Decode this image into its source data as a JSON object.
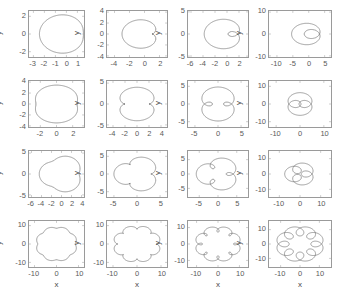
{
  "figure": {
    "title": "",
    "rows": 4,
    "cols": 4,
    "axis_color": "#9a9a9a",
    "curve_color": "#555555",
    "tick_color": "#5a5a5a",
    "background": "#ffffff"
  },
  "chart_data": {
    "type": "line",
    "title": "",
    "xlabel": "x",
    "ylabel": "y",
    "grid": false,
    "legend": "none",
    "panels": [
      {
        "row": 1,
        "col": 1,
        "k": 1,
        "d": 0.45,
        "xlabel": "",
        "ylabel": "y",
        "xlim": [
          -3.4,
          1.6
        ],
        "ylim": [
          -2.6,
          2.6
        ],
        "xticks": [
          -3,
          -2,
          -1,
          0,
          1
        ],
        "xticklabels": [
          "-3",
          "-2",
          "-1",
          "0",
          "1"
        ],
        "yticks": [
          -2,
          0,
          2
        ],
        "yticklabels": [
          "-2",
          "0",
          "2"
        ]
      },
      {
        "row": 1,
        "col": 2,
        "k": 1,
        "d": 1.0,
        "xlabel": "",
        "ylabel": "y",
        "xlim": [
          -5.0,
          3.0
        ],
        "ylim": [
          -4.2,
          4.2
        ],
        "xticks": [
          -4,
          -2,
          0,
          2
        ],
        "xticklabels": [
          "-4",
          "-2",
          "0",
          "2"
        ],
        "yticks": [
          -4,
          -2,
          0,
          2,
          4
        ],
        "yticklabels": [
          "-4",
          "-2",
          "0",
          "2",
          "4"
        ]
      },
      {
        "row": 1,
        "col": 3,
        "k": 1,
        "d": 1.8,
        "xlabel": "",
        "ylabel": "y",
        "xlim": [
          -6.5,
          3.5
        ],
        "ylim": [
          -5.2,
          5.2
        ],
        "xticks": [
          -6,
          -4,
          -2,
          0,
          2
        ],
        "xticklabels": [
          "-6",
          "-4",
          "-2",
          "0",
          "2"
        ],
        "yticks": [
          -5,
          0,
          5
        ],
        "yticklabels": [
          "-5",
          "0",
          "5"
        ]
      },
      {
        "row": 1,
        "col": 4,
        "k": 1,
        "d": 3.4,
        "xlabel": "",
        "ylabel": "y",
        "xlim": [
          -12.5,
          7.0
        ],
        "ylim": [
          -10.5,
          10.5
        ],
        "xticks": [
          -10,
          -5,
          0,
          5
        ],
        "xticklabels": [
          "-10",
          "-5",
          "0",
          "5"
        ],
        "yticks": [
          -10,
          0,
          10
        ],
        "yticklabels": [
          "-10",
          "0",
          "10"
        ]
      },
      {
        "row": 2,
        "col": 1,
        "k": 2,
        "d": 0.45,
        "xlabel": "",
        "ylabel": "y",
        "xlim": [
          -3.4,
          3.4
        ],
        "ylim": [
          -4.2,
          4.2
        ],
        "xticks": [
          -2,
          0,
          2
        ],
        "xticklabels": [
          "-2",
          "0",
          "2"
        ],
        "yticks": [
          -4,
          -2,
          0,
          2,
          4
        ],
        "yticklabels": [
          "-4",
          "-2",
          "0",
          "2",
          "4"
        ]
      },
      {
        "row": 2,
        "col": 2,
        "k": 2,
        "d": 1.0,
        "xlabel": "",
        "ylabel": "y",
        "xlim": [
          -5.0,
          5.0
        ],
        "ylim": [
          -5.5,
          5.5
        ],
        "xticks": [
          -4,
          -2,
          0,
          2,
          4
        ],
        "xticklabels": [
          "-4",
          "-2",
          "0",
          "2",
          "4"
        ],
        "yticks": [
          -5,
          0,
          5
        ],
        "yticklabels": [
          "-5",
          "0",
          "5"
        ]
      },
      {
        "row": 2,
        "col": 3,
        "k": 2,
        "d": 1.8,
        "xlabel": "",
        "ylabel": "y",
        "xlim": [
          -6.5,
          6.5
        ],
        "ylim": [
          -6.5,
          6.5
        ],
        "xticks": [
          -5,
          0,
          5
        ],
        "xticklabels": [
          "-5",
          "0",
          "5"
        ],
        "yticks": [
          -5,
          0,
          5
        ],
        "yticklabels": [
          "-5",
          "0",
          "5"
        ]
      },
      {
        "row": 2,
        "col": 4,
        "k": 2,
        "d": 3.4,
        "xlabel": "",
        "ylabel": "y",
        "xlim": [
          -13.0,
          13.0
        ],
        "ylim": [
          -13.0,
          13.0
        ],
        "xticks": [
          -10,
          0,
          10
        ],
        "xticklabels": [
          "-10",
          "0",
          "10"
        ],
        "yticks": [
          -10,
          0,
          10
        ],
        "yticklabels": [
          "-10",
          "0",
          "10"
        ]
      },
      {
        "row": 3,
        "col": 1,
        "k": 3,
        "d": 0.45,
        "xlabel": "",
        "ylabel": "y",
        "xlim": [
          -6.5,
          4.5
        ],
        "ylim": [
          -5.5,
          5.5
        ],
        "xticks": [
          -6,
          -4,
          -2,
          0,
          2,
          4
        ],
        "xticklabels": [
          "-6",
          "-4",
          "-2",
          "0",
          "2",
          "4"
        ],
        "yticks": [
          -5,
          0,
          5
        ],
        "yticklabels": [
          "-5",
          "0",
          "5"
        ]
      },
      {
        "row": 3,
        "col": 2,
        "k": 3,
        "d": 1.0,
        "xlabel": "",
        "ylabel": "y",
        "xlim": [
          -6.5,
          6.5
        ],
        "ylim": [
          -6.5,
          6.5
        ],
        "xticks": [
          -5,
          0,
          5
        ],
        "xticklabels": [
          "-5",
          "0",
          "5"
        ],
        "yticks": [
          -5,
          0,
          5
        ],
        "yticklabels": [
          "-5",
          "0",
          "5"
        ]
      },
      {
        "row": 3,
        "col": 3,
        "k": 3,
        "d": 1.8,
        "xlabel": "",
        "ylabel": "y",
        "xlim": [
          -8.0,
          8.0
        ],
        "ylim": [
          -8.0,
          8.0
        ],
        "xticks": [
          -5,
          0,
          5
        ],
        "xticklabels": [
          "-5",
          "0",
          "5"
        ],
        "yticks": [
          -5,
          0,
          5
        ],
        "yticklabels": [
          "-5",
          "0",
          "5"
        ]
      },
      {
        "row": 3,
        "col": 4,
        "k": 3,
        "d": 3.4,
        "xlabel": "",
        "ylabel": "y",
        "xlim": [
          -15.0,
          15.0
        ],
        "ylim": [
          -15.0,
          15.0
        ],
        "xticks": [
          -10,
          0,
          10
        ],
        "xticklabels": [
          "-10",
          "0",
          "10"
        ],
        "yticks": [
          -10,
          0,
          10
        ],
        "yticklabels": [
          "-10",
          "0",
          "10"
        ]
      },
      {
        "row": 4,
        "col": 1,
        "k": 8,
        "d": 0.45,
        "xlabel": "x",
        "ylabel": "y",
        "xlim": [
          -12.5,
          12.5
        ],
        "ylim": [
          -12.5,
          12.5
        ],
        "xticks": [
          -10,
          0,
          10
        ],
        "xticklabels": [
          "-10",
          "0",
          "10"
        ],
        "yticks": [
          -10,
          0,
          10
        ],
        "yticklabels": [
          "-10",
          "0",
          "10"
        ]
      },
      {
        "row": 4,
        "col": 2,
        "k": 8,
        "d": 1.0,
        "xlabel": "x",
        "ylabel": "y",
        "xlim": [
          -12.5,
          12.5
        ],
        "ylim": [
          -12.5,
          12.5
        ],
        "xticks": [
          -10,
          0,
          10
        ],
        "xticklabels": [
          "-10",
          "0",
          "10"
        ],
        "yticks": [
          -10,
          0,
          10
        ],
        "yticklabels": [
          "-10",
          "0",
          "10"
        ]
      },
      {
        "row": 4,
        "col": 3,
        "k": 8,
        "d": 1.8,
        "xlabel": "x",
        "ylabel": "y",
        "xlim": [
          -14.0,
          14.0
        ],
        "ylim": [
          -14.0,
          14.0
        ],
        "xticks": [
          -10,
          0,
          10
        ],
        "xticklabels": [
          "-10",
          "0",
          "10"
        ],
        "yticks": [
          -10,
          0,
          10
        ],
        "yticklabels": [
          "-10",
          "0",
          "10"
        ]
      },
      {
        "row": 4,
        "col": 4,
        "k": 8,
        "d": 3.4,
        "xlabel": "x",
        "ylabel": "y",
        "xlim": [
          -16.0,
          16.0
        ],
        "ylim": [
          -16.0,
          16.0
        ],
        "xticks": [
          -10,
          0,
          10
        ],
        "xticklabels": [
          "-10",
          "0",
          "10"
        ],
        "yticks": [
          -10,
          0,
          10
        ],
        "yticklabels": [
          "-10",
          "0",
          "10"
        ]
      }
    ]
  }
}
